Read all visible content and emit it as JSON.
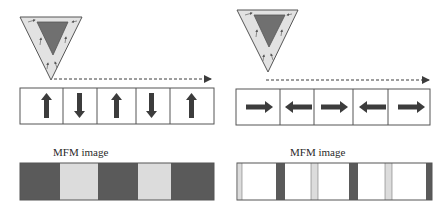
{
  "left_panel": {
    "description": "Perpendicular magnetization",
    "domains": [
      "up",
      "down",
      "up",
      "down",
      "up"
    ],
    "mfm_label": "MFM image",
    "mfm_segments": [
      "dark",
      "light",
      "dark",
      "light",
      "dark"
    ]
  },
  "right_panel": {
    "description": "In-plane magnetization",
    "domains": [
      "right",
      "left",
      "right",
      "left",
      "right"
    ],
    "mfm_label": "MFM image",
    "mfm_segments": [
      "light-edge",
      "white",
      "dark",
      "white",
      "light",
      "white",
      "dark",
      "white",
      "light",
      "white",
      "dark-edge"
    ]
  },
  "colors": {
    "tip_outer": "#e2e2e2",
    "tip_inner": "#6e6e6e",
    "arrow": "#3c3c3c",
    "mfm_dark": "#5a5a5a",
    "mfm_light": "#dcdcdc",
    "border": "#555555"
  }
}
